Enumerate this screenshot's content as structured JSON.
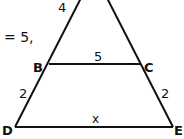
{
  "diagram": {
    "fragment_text": "= 5,",
    "vertices": {
      "B": {
        "label": "B"
      },
      "C": {
        "label": "C"
      },
      "D": {
        "label": "D"
      },
      "E": {
        "label": "E"
      }
    },
    "segment_labels": {
      "top_left": "4",
      "BC": "5",
      "BD": "2",
      "CE": "2",
      "DE": "x"
    },
    "line_color": "#111111"
  }
}
